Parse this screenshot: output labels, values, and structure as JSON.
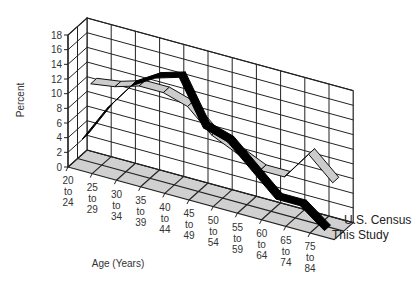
{
  "chart_data": {
    "type": "line",
    "subtype": "3d-ribbon",
    "title": "",
    "xlabel": "Age (Years)",
    "ylabel": "Percent",
    "ylim": [
      0,
      18
    ],
    "yticks": [
      0,
      2,
      4,
      6,
      8,
      10,
      12,
      14,
      16,
      18
    ],
    "grid": true,
    "legend_position": "right-front",
    "categories": [
      "20 to 24",
      "25 to 29",
      "30 to 34",
      "35 to 39",
      "40 to 44",
      "45 to 49",
      "50 to 54",
      "55 to 59",
      "60 to 64",
      "65 to 74",
      "75 to 84"
    ],
    "category_lines": [
      [
        "20",
        "to",
        "24"
      ],
      [
        "25",
        "to",
        "29"
      ],
      [
        "30",
        "to",
        "34"
      ],
      [
        "35",
        "to",
        "39"
      ],
      [
        "40",
        "to",
        "44"
      ],
      [
        "45",
        "to",
        "49"
      ],
      [
        "50",
        "to",
        "54"
      ],
      [
        "55",
        "to",
        "59"
      ],
      [
        "60",
        "to",
        "64"
      ],
      [
        "65",
        "to",
        "74"
      ],
      [
        "75",
        "to",
        "84"
      ]
    ],
    "series": [
      {
        "name": "U.S. Census",
        "color": "#cccccc",
        "depth": "back",
        "values": [
          10.5,
          11,
          12,
          12,
          11,
          8,
          6.5,
          5,
          5,
          9,
          6
        ]
      },
      {
        "name": "This Study",
        "color": "#000000",
        "depth": "front",
        "values": [
          4,
          9,
          13,
          15,
          16,
          10,
          9,
          6,
          3,
          3,
          0.5
        ]
      }
    ]
  },
  "labels": {
    "ylabel": "Percent",
    "xlabel": "Age (Years)",
    "legend": [
      "U.S. Census",
      "This Study"
    ]
  },
  "colors": {
    "floor": "#d0d0d0",
    "grid": "#222222",
    "census": "#cccccc",
    "study": "#000000"
  }
}
